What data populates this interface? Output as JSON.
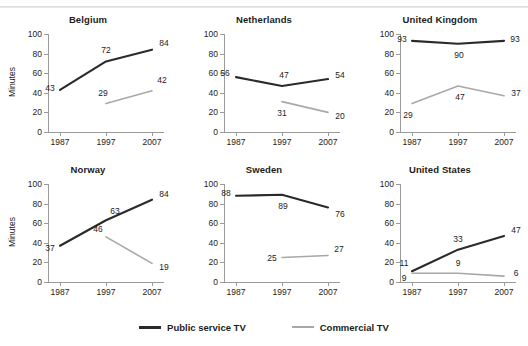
{
  "chart_data": {
    "type": "line",
    "title": "",
    "xlabel": "",
    "ylabel": "Minutes",
    "x": [
      "1987",
      "1997",
      "2007"
    ],
    "ylim": [
      0,
      100
    ],
    "yticks": [
      0,
      20,
      40,
      60,
      80,
      100
    ],
    "grid": false,
    "legend_position": "bottom-center",
    "legend": [
      {
        "name": "Public service TV",
        "color": "#2a2a2a"
      },
      {
        "name": "Commercial TV",
        "color": "#a8a8a8"
      }
    ],
    "panels": [
      {
        "title": "Belgium",
        "series": [
          {
            "name": "Public service TV",
            "x": [
              "1987",
              "1997",
              "2007"
            ],
            "values": [
              43,
              72,
              84
            ],
            "labels": [
              "43",
              "72",
              "84"
            ]
          },
          {
            "name": "Commercial TV",
            "x": [
              "1997",
              "2007"
            ],
            "values": [
              29,
              42
            ],
            "labels": [
              "29",
              "42"
            ]
          }
        ]
      },
      {
        "title": "Netherlands",
        "series": [
          {
            "name": "Public service TV",
            "x": [
              "1987",
              "1997",
              "2007"
            ],
            "values": [
              56,
              47,
              54
            ],
            "labels": [
              "56",
              "47",
              "54"
            ]
          },
          {
            "name": "Commercial TV",
            "x": [
              "1997",
              "2007"
            ],
            "values": [
              31,
              20
            ],
            "labels": [
              "31",
              "20"
            ]
          }
        ]
      },
      {
        "title": "United Kingdom",
        "series": [
          {
            "name": "Public service TV",
            "x": [
              "1987",
              "1997",
              "2007"
            ],
            "values": [
              93,
              90,
              93
            ],
            "labels": [
              "93",
              "90",
              "93"
            ]
          },
          {
            "name": "Commercial TV",
            "x": [
              "1987",
              "1997",
              "2007"
            ],
            "values": [
              29,
              47,
              37
            ],
            "labels": [
              "29",
              "47",
              "37"
            ]
          }
        ]
      },
      {
        "title": "Norway",
        "series": [
          {
            "name": "Public service TV",
            "x": [
              "1987",
              "1997",
              "2007"
            ],
            "values": [
              37,
              63,
              84
            ],
            "labels": [
              "37",
              "63",
              "84"
            ]
          },
          {
            "name": "Commercial TV",
            "x": [
              "1997",
              "2007"
            ],
            "values": [
              46,
              19
            ],
            "labels": [
              "46",
              "19"
            ]
          }
        ]
      },
      {
        "title": "Sweden",
        "series": [
          {
            "name": "Public service TV",
            "x": [
              "1987",
              "1997",
              "2007"
            ],
            "values": [
              88,
              89,
              76
            ],
            "labels": [
              "88",
              "89",
              "76"
            ]
          },
          {
            "name": "Commercial TV",
            "x": [
              "1997",
              "2007"
            ],
            "values": [
              25,
              27
            ],
            "labels": [
              "25",
              "27"
            ]
          }
        ]
      },
      {
        "title": "United States",
        "series": [
          {
            "name": "Public service TV",
            "x": [
              "1987",
              "1997",
              "2007"
            ],
            "values": [
              11,
              33,
              47
            ],
            "labels": [
              "11",
              "33",
              "47"
            ]
          },
          {
            "name": "Commercial TV",
            "x": [
              "1987",
              "1997",
              "2007"
            ],
            "values": [
              9,
              9,
              6
            ],
            "labels": [
              "9",
              "9",
              "6"
            ]
          }
        ]
      }
    ]
  }
}
